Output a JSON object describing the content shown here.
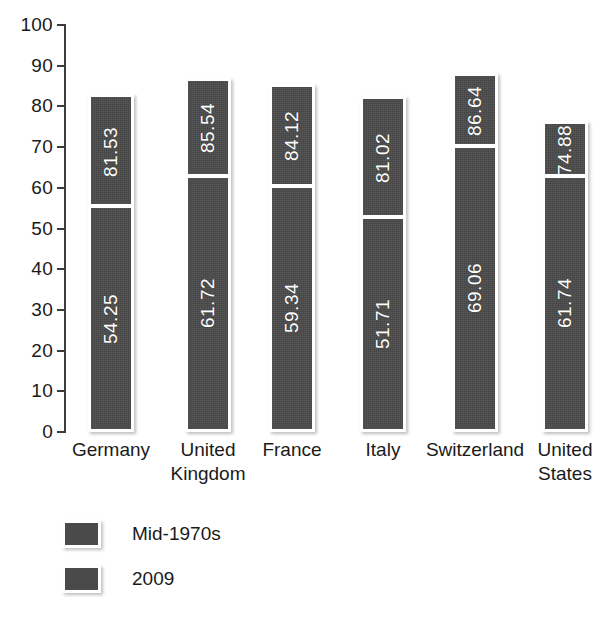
{
  "chart_data": {
    "type": "bar",
    "subtype": "stacked-overlay-column",
    "title": "",
    "subtitle": "",
    "xlabel": "",
    "ylabel": "",
    "ylim": [
      0,
      100
    ],
    "yticks": [
      0,
      10,
      20,
      30,
      40,
      50,
      60,
      70,
      80,
      90,
      100
    ],
    "ytick_labels": [
      "0",
      "10",
      "20",
      "30",
      "40",
      "50",
      "60",
      "70",
      "80",
      "90",
      "100"
    ],
    "grid": false,
    "legend_position": "bottom-left",
    "categories": [
      "Germany",
      "United Kingdom",
      "France",
      "Italy",
      "Switzerland",
      "United States"
    ],
    "series": [
      {
        "name": "Mid-1970s",
        "color": "#4a4a4a",
        "values": [
          54.25,
          61.72,
          59.34,
          51.71,
          69.06,
          61.74
        ],
        "labels": [
          "54.25",
          "61.72",
          "59.34",
          "51.71",
          "69.06",
          "61.74"
        ]
      },
      {
        "name": "2009",
        "color": "#4a4a4a",
        "values": [
          81.53,
          85.54,
          84.12,
          81.02,
          86.64,
          74.88
        ],
        "labels": [
          "81.53",
          "85.54",
          "84.12",
          "81.02",
          "86.64",
          "74.88"
        ]
      }
    ]
  },
  "axis": {
    "ticks": [
      {
        "value": 100,
        "label": "100"
      },
      {
        "value": 90,
        "label": "90"
      },
      {
        "value": 80,
        "label": "80"
      },
      {
        "value": 70,
        "label": "70"
      },
      {
        "value": 60,
        "label": "60"
      },
      {
        "value": 50,
        "label": "50"
      },
      {
        "value": 40,
        "label": "40"
      },
      {
        "value": 30,
        "label": "30"
      },
      {
        "value": 20,
        "label": "20"
      },
      {
        "value": 10,
        "label": "10"
      },
      {
        "value": 0,
        "label": "0"
      }
    ]
  },
  "bars": [
    {
      "category": "Germany",
      "label_lines": [
        "Germany"
      ],
      "top_value": 81.53,
      "top_label": "81.53",
      "bottom_value": 54.25,
      "bottom_label": "54.25"
    },
    {
      "category": "United Kingdom",
      "label_lines": [
        "United",
        "Kingdom"
      ],
      "top_value": 85.54,
      "top_label": "85.54",
      "bottom_value": 61.72,
      "bottom_label": "61.72"
    },
    {
      "category": "France",
      "label_lines": [
        "France"
      ],
      "top_value": 84.12,
      "top_label": "84.12",
      "bottom_value": 59.34,
      "bottom_label": "59.34"
    },
    {
      "category": "Italy",
      "label_lines": [
        "Italy"
      ],
      "top_value": 81.02,
      "top_label": "81.02",
      "bottom_value": 51.71,
      "bottom_label": "51.71"
    },
    {
      "category": "Switzerland",
      "label_lines": [
        "Switzerland"
      ],
      "top_value": 86.64,
      "top_label": "86.64",
      "bottom_value": 69.06,
      "bottom_label": "69.06"
    },
    {
      "category": "United States",
      "label_lines": [
        "United",
        "States"
      ],
      "top_value": 74.88,
      "top_label": "74.88",
      "bottom_value": 61.74,
      "bottom_label": "61.74"
    }
  ],
  "legend": {
    "items": [
      {
        "label": "Mid-1970s",
        "color": "#4a4a4a"
      },
      {
        "label": "2009",
        "color": "#4a4a4a"
      }
    ]
  },
  "colors": {
    "bar_fill": "#4a4a4a",
    "bar_outline": "#ffffff",
    "axis": "#3c3c3c",
    "text": "#1a1a1a",
    "value_text": "#ffffff",
    "background": "#ffffff"
  }
}
